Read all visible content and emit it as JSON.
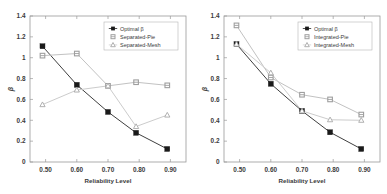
{
  "figure": {
    "panels": [
      {
        "name": "left-panel",
        "chart_data": {
          "type": "line",
          "title": "",
          "xlabel": "Reliability Level",
          "ylabel": "β",
          "xlim": [
            0.45,
            0.95
          ],
          "ylim": [
            0,
            1.4
          ],
          "xticks": [
            "0.50",
            "0.60",
            "0.70",
            "0.80",
            "0.90"
          ],
          "xtick_values": [
            0.5,
            0.6,
            0.7,
            0.8,
            0.9
          ],
          "yticks": [
            "0",
            "0.2",
            "0.4",
            "0.6",
            "0.8",
            "1",
            "1.2",
            "1.4"
          ],
          "ytick_values": [
            0,
            0.2,
            0.4,
            0.6,
            0.8,
            1.0,
            1.2,
            1.4
          ],
          "grid": false,
          "legend_position": "top-right",
          "x": [
            0.49,
            0.6,
            0.7,
            0.79,
            0.89
          ],
          "series": [
            {
              "name": "Optimal β",
              "marker": "square",
              "color": "#1a1a1a",
              "line_color": "#3f3f3f",
              "values": [
                1.11,
                0.74,
                0.48,
                0.28,
                0.125
              ]
            },
            {
              "name": "Separated-Pie",
              "marker": "circle",
              "color": "#9e9e9e",
              "line_color": "#c2c2c2",
              "values": [
                1.02,
                1.04,
                0.73,
                0.765,
                0.735
              ]
            },
            {
              "name": "Separated-Mesh",
              "marker": "triangle",
              "color": "#a8a8a8",
              "line_color": "#cccccc",
              "values": [
                0.55,
                0.69,
                0.73,
                0.34,
                0.45
              ]
            }
          ]
        }
      },
      {
        "name": "right-panel",
        "chart_data": {
          "type": "line",
          "title": "",
          "xlabel": "Reliability Level",
          "ylabel": "β",
          "xlim": [
            0.45,
            0.95
          ],
          "ylim": [
            0,
            1.4
          ],
          "xticks": [
            "0.50",
            "0.60",
            "0.70",
            "0.80",
            "0.90"
          ],
          "xtick_values": [
            0.5,
            0.6,
            0.7,
            0.8,
            0.9
          ],
          "yticks": [
            "0",
            "0.2",
            "0.4",
            "0.6",
            "0.8",
            "1",
            "1.2",
            "1.4"
          ],
          "ytick_values": [
            0,
            0.2,
            0.4,
            0.6,
            0.8,
            1.0,
            1.2,
            1.4
          ],
          "grid": false,
          "legend_position": "top-right",
          "x": [
            0.49,
            0.6,
            0.7,
            0.79,
            0.89
          ],
          "series": [
            {
              "name": "Optimal β",
              "marker": "square",
              "color": "#1a1a1a",
              "line_color": "#3f3f3f",
              "values": [
                1.13,
                0.75,
                0.49,
                0.285,
                0.125
              ]
            },
            {
              "name": "Integrated-Pie",
              "marker": "circle",
              "color": "#9e9e9e",
              "line_color": "#c2c2c2",
              "values": [
                1.31,
                0.81,
                0.645,
                0.6,
                0.455
              ]
            },
            {
              "name": "Integrated-Mesh",
              "marker": "triangle",
              "color": "#a8a8a8",
              "line_color": "#cccccc",
              "values": [
                1.13,
                0.855,
                0.49,
                0.405,
                0.4
              ]
            }
          ]
        }
      }
    ]
  }
}
